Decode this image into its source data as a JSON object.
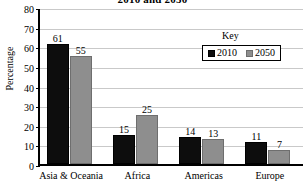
{
  "chart_data": {
    "type": "bar",
    "title": "2010 and 2050",
    "xlabel": "",
    "ylabel": "Percentage",
    "ylim": [
      0,
      80
    ],
    "ytick_step": 10,
    "yticks": [
      0,
      10,
      20,
      30,
      40,
      50,
      60,
      70,
      80
    ],
    "grid": true,
    "legend_title": "Key",
    "legend_position": "upper-right-inside",
    "categories": [
      "Asia & Oceania",
      "Africa",
      "Americas",
      "Europe"
    ],
    "series": [
      {
        "name": "2010",
        "color": "#0d0d0d",
        "values": [
          61,
          15,
          14,
          11
        ]
      },
      {
        "name": "2050",
        "color": "#8e8e8e",
        "values": [
          55,
          25,
          13,
          7
        ]
      }
    ],
    "data_labels": [
      [
        "61",
        "55"
      ],
      [
        "15",
        "25"
      ],
      [
        "14",
        "13"
      ],
      [
        "11",
        "7"
      ]
    ]
  }
}
